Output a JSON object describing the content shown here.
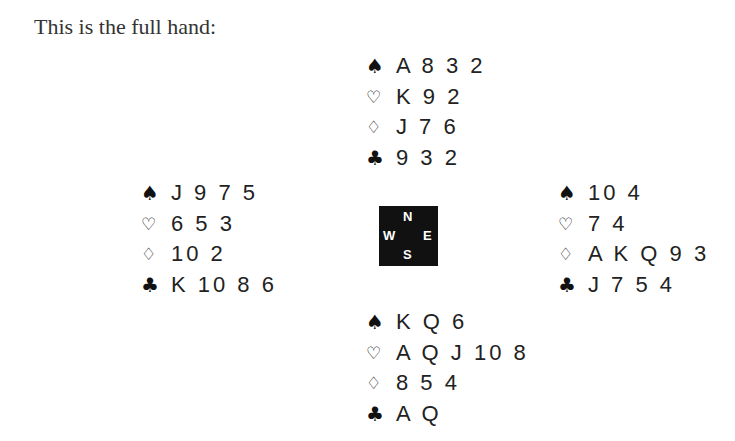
{
  "intro": "This is the full hand:",
  "suit_icons": {
    "spades": "♠",
    "hearts": "♡",
    "diamonds": "♢",
    "clubs": "♣"
  },
  "compass": {
    "n": "N",
    "w": "W",
    "e": "E",
    "s": "S"
  },
  "hands": {
    "north": {
      "spades": "A 8 3 2",
      "hearts": "K 9 2",
      "diamonds": "J 7 6",
      "clubs": "9 3 2"
    },
    "west": {
      "spades": "J 9 7 5",
      "hearts": "6 5 3",
      "diamonds": "10 2",
      "clubs": "K 10 8 6"
    },
    "east": {
      "spades": "10 4",
      "hearts": "7 4",
      "diamonds": "A K Q 9 3",
      "clubs": "J 7 5 4"
    },
    "south": {
      "spades": "K Q 6",
      "hearts": "A Q J 10 8",
      "diamonds": "8 5 4",
      "clubs": "A Q"
    }
  }
}
